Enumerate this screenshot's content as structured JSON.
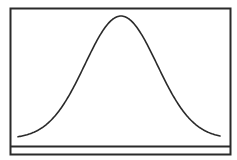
{
  "diagram": {
    "type": "normal-distribution-curve",
    "colors": {
      "background": "#ffffff",
      "frame": "#2a2a2a",
      "curve": "#2a2a2a"
    },
    "frame": {
      "x": 10.5,
      "y": 8.5,
      "width": 220,
      "height": 146
    },
    "baseline": {
      "y": 146.5
    },
    "curve": {
      "mean_x": 121,
      "peak_y": 16,
      "base_y": 136,
      "start_x": 18,
      "end_x": 220,
      "sigma_px": 36
    }
  }
}
